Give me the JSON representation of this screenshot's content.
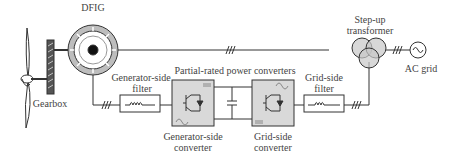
{
  "diagram": {
    "labels": {
      "dfig": "DFIG",
      "gearbox": "Gearbox",
      "gen_filter_line1": "Generator-side",
      "gen_filter_line2": "filter",
      "partial_converters": "Partial-rated power converters",
      "gen_conv_line1": "Generator-side",
      "gen_conv_line2": "converter",
      "grid_conv_line1": "Grid-side",
      "grid_conv_line2": "converter",
      "grid_filter_line1": "Grid-side",
      "grid_filter_line2": "filter",
      "transformer_line1": "Step-up",
      "transformer_line2": "transformer",
      "ac_grid": "AC grid"
    },
    "components": [
      {
        "id": "wind-turbine-rotor",
        "icon": "turbine-blades-icon"
      },
      {
        "id": "gearbox",
        "icon": "gearbox-icon"
      },
      {
        "id": "dfig",
        "icon": "generator-icon"
      },
      {
        "id": "generator-side-filter",
        "icon": "inductor-icon"
      },
      {
        "id": "generator-side-converter",
        "icon": "igbt-icon"
      },
      {
        "id": "dc-link-capacitor",
        "icon": "capacitor-icon"
      },
      {
        "id": "grid-side-converter",
        "icon": "igbt-icon"
      },
      {
        "id": "grid-side-filter",
        "icon": "inductor-icon"
      },
      {
        "id": "step-up-transformer",
        "icon": "transformer-icon"
      },
      {
        "id": "ac-grid",
        "icon": "ac-source-icon"
      }
    ],
    "colors": {
      "line": "#333333",
      "fill_grey": "#c8c8c8",
      "box_fill": "#d9d9d9"
    }
  }
}
